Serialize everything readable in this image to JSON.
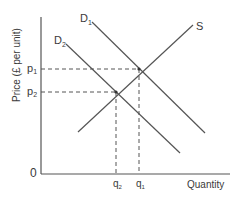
{
  "diagram": {
    "type": "supply-demand",
    "y_axis_label": "Price (£ per unit)",
    "x_axis_label": "Quantity",
    "origin_label": "0",
    "curves": [
      {
        "id": "D1",
        "label": "D",
        "subscript": "1"
      },
      {
        "id": "D2",
        "label": "D",
        "subscript": "2"
      },
      {
        "id": "S",
        "label": "S",
        "subscript": ""
      }
    ],
    "price_levels": [
      {
        "label": "p",
        "subscript": "1"
      },
      {
        "label": "p",
        "subscript": "2"
      }
    ],
    "quantity_levels": [
      {
        "label": "q",
        "subscript": "2"
      },
      {
        "label": "q",
        "subscript": "1"
      }
    ],
    "colors": {
      "line": "#555555",
      "text": "#3a3a3a"
    }
  }
}
